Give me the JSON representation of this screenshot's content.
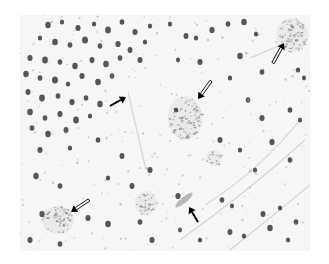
{
  "figure": {
    "type": "grayscale histology micrograph",
    "background_color": "#ffffff",
    "tissue_color": "#f6f6f6",
    "nucleus_color": "#3a3a3a",
    "plaque_color": "#8a8a8a",
    "arrow_color": "#000000",
    "image_box": {
      "x": 20,
      "y": 15,
      "width": 290,
      "height": 236
    }
  },
  "nuclei": [
    [
      48,
      25,
      3.2
    ],
    [
      62,
      22,
      2.5
    ],
    [
      78,
      28,
      3
    ],
    [
      94,
      24,
      2.6
    ],
    [
      108,
      30,
      3.4
    ],
    [
      122,
      22,
      2.8
    ],
    [
      135,
      32,
      3
    ],
    [
      150,
      26,
      2.5
    ],
    [
      40,
      38,
      2.6
    ],
    [
      55,
      42,
      3.3
    ],
    [
      70,
      45,
      2.8
    ],
    [
      85,
      40,
      3.5
    ],
    [
      100,
      46,
      2.7
    ],
    [
      118,
      44,
      3.1
    ],
    [
      130,
      50,
      2.9
    ],
    [
      145,
      42,
      2.6
    ],
    [
      30,
      58,
      3
    ],
    [
      45,
      60,
      3.4
    ],
    [
      60,
      62,
      2.7
    ],
    [
      75,
      66,
      3.2
    ],
    [
      92,
      60,
      2.9
    ],
    [
      106,
      64,
      3.3
    ],
    [
      120,
      58,
      2.7
    ],
    [
      140,
      60,
      3
    ],
    [
      26,
      74,
      3.2
    ],
    [
      40,
      78,
      2.8
    ],
    [
      55,
      80,
      3.5
    ],
    [
      68,
      84,
      2.6
    ],
    [
      82,
      76,
      3
    ],
    [
      98,
      82,
      3.3
    ],
    [
      112,
      76,
      2.7
    ],
    [
      28,
      92,
      2.9
    ],
    [
      42,
      98,
      3.4
    ],
    [
      58,
      96,
      2.8
    ],
    [
      72,
      102,
      3.1
    ],
    [
      86,
      98,
      2.7
    ],
    [
      100,
      104,
      3.2
    ],
    [
      30,
      112,
      3.3
    ],
    [
      45,
      118,
      2.7
    ],
    [
      60,
      114,
      3
    ],
    [
      76,
      120,
      3.4
    ],
    [
      90,
      116,
      2.6
    ],
    [
      32,
      128,
      2.8
    ],
    [
      48,
      134,
      3.2
    ],
    [
      66,
      130,
      2.9
    ],
    [
      40,
      150,
      3
    ],
    [
      70,
      148,
      2.6
    ],
    [
      98,
      140,
      2.7
    ],
    [
      122,
      156,
      2.9
    ],
    [
      150,
      170,
      3
    ],
    [
      36,
      176,
      3.2
    ],
    [
      60,
      186,
      2.8
    ],
    [
      108,
      178,
      2.6
    ],
    [
      132,
      186,
      2.9
    ],
    [
      42,
      214,
      3.1
    ],
    [
      88,
      218,
      3
    ],
    [
      108,
      224,
      3.3
    ],
    [
      140,
      222,
      2.8
    ],
    [
      152,
      240,
      3
    ],
    [
      60,
      244,
      2.7
    ],
    [
      30,
      240,
      3
    ],
    [
      170,
      24,
      2.6
    ],
    [
      186,
      36,
      2.9
    ],
    [
      196,
      38,
      2.6
    ],
    [
      212,
      30,
      3.1
    ],
    [
      228,
      24,
      2.7
    ],
    [
      244,
      22,
      3.2
    ],
    [
      256,
      34,
      2.5
    ],
    [
      178,
      60,
      2.4
    ],
    [
      200,
      62,
      3
    ],
    [
      240,
      56,
      3.2
    ],
    [
      230,
      78,
      2.6
    ],
    [
      262,
      72,
      2.8
    ],
    [
      298,
      70,
      2.6
    ],
    [
      304,
      78,
      2.4
    ],
    [
      176,
      110,
      2.6
    ],
    [
      248,
      100,
      2.7
    ],
    [
      262,
      118,
      3
    ],
    [
      290,
      110,
      2.8
    ],
    [
      300,
      120,
      2.5
    ],
    [
      220,
      140,
      2.9
    ],
    [
      240,
      150,
      2.6
    ],
    [
      272,
      142,
      3.1
    ],
    [
      290,
      160,
      2.7
    ],
    [
      255,
      170,
      2.5
    ],
    [
      178,
      196,
      3.1
    ],
    [
      222,
      200,
      2.7
    ],
    [
      232,
      206,
      2.4
    ],
    [
      263,
      214,
      2.9
    ],
    [
      280,
      208,
      2.6
    ],
    [
      230,
      232,
      2.9
    ],
    [
      244,
      236,
      2.6
    ],
    [
      270,
      228,
      3.2
    ],
    [
      288,
      240,
      2.6
    ],
    [
      296,
      222,
      2.7
    ],
    [
      200,
      240,
      2.5
    ],
    [
      180,
      230,
      2.4
    ]
  ],
  "plaques": [
    {
      "cx": 185,
      "cy": 118,
      "rx": 17,
      "ry": 22
    },
    {
      "cx": 292,
      "cy": 35,
      "rx": 16,
      "ry": 17
    },
    {
      "cx": 58,
      "cy": 220,
      "rx": 16,
      "ry": 14
    },
    {
      "cx": 146,
      "cy": 203,
      "rx": 11,
      "ry": 12
    },
    {
      "cx": 214,
      "cy": 158,
      "rx": 8,
      "ry": 8
    }
  ],
  "arrows": [
    {
      "id": "solid-arrow-1",
      "style": "solid",
      "tail": [
        110,
        106
      ],
      "head": [
        126,
        97
      ],
      "target": "thin cell process"
    },
    {
      "id": "open-arrow-1",
      "style": "open",
      "tail": [
        211,
        81
      ],
      "head": [
        198,
        99
      ],
      "target": "plaque"
    },
    {
      "id": "open-arrow-2",
      "style": "open",
      "tail": [
        273,
        63
      ],
      "head": [
        284,
        43
      ],
      "target": "plaque"
    },
    {
      "id": "open-arrow-3",
      "style": "open",
      "tail": [
        89,
        200
      ],
      "head": [
        71,
        212
      ],
      "target": "plaque"
    },
    {
      "id": "solid-arrow-2",
      "style": "solid",
      "tail": [
        198,
        222
      ],
      "head": [
        189,
        207
      ],
      "target": "elongated cell"
    }
  ]
}
